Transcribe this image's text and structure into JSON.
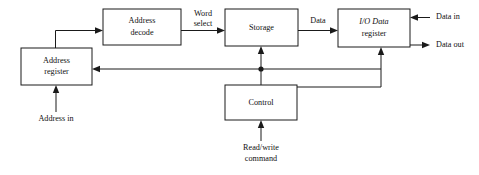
{
  "diagram": {
    "colors": {
      "background": "#ffffff",
      "stroke": "#1a1a1a",
      "text": "#111111",
      "box_fill": "#ffffff"
    },
    "blocks": [
      {
        "id": "address-register",
        "label_line1": "Address",
        "label_line2": "register",
        "x": 21,
        "y": 48,
        "w": 71,
        "h": 37
      },
      {
        "id": "address-decode",
        "label_line1": "Address",
        "label_line2": "decode",
        "x": 103,
        "y": 9,
        "w": 78,
        "h": 36
      },
      {
        "id": "storage",
        "label_line1": "Storage",
        "label_line2": "",
        "x": 225,
        "y": 9,
        "w": 73,
        "h": 37
      },
      {
        "id": "io-data-register",
        "label_line1": "I/O Data",
        "label_line2": "register",
        "x": 338,
        "y": 9,
        "w": 72,
        "h": 38
      },
      {
        "id": "control",
        "label_line1": "Control",
        "label_line2": "",
        "x": 225,
        "y": 85,
        "w": 72,
        "h": 35
      }
    ],
    "edge_labels": [
      {
        "id": "word-select",
        "line1": "Word",
        "line2": "select",
        "x": 203,
        "y": 14
      },
      {
        "id": "data",
        "line1": "Data",
        "line2": "",
        "x": 318,
        "y": 20
      }
    ],
    "io_labels": [
      {
        "id": "data-in",
        "text": "Data in",
        "x": 436,
        "y": 17
      },
      {
        "id": "data-out",
        "text": "Data out",
        "x": 436,
        "y": 45
      }
    ],
    "input_labels": [
      {
        "id": "address-in",
        "line1": "Address in",
        "line2": "",
        "x": 56,
        "y": 119
      },
      {
        "id": "read-write-command",
        "line1": "Read/write",
        "line2": "command",
        "x": 261,
        "y": 148
      }
    ]
  }
}
